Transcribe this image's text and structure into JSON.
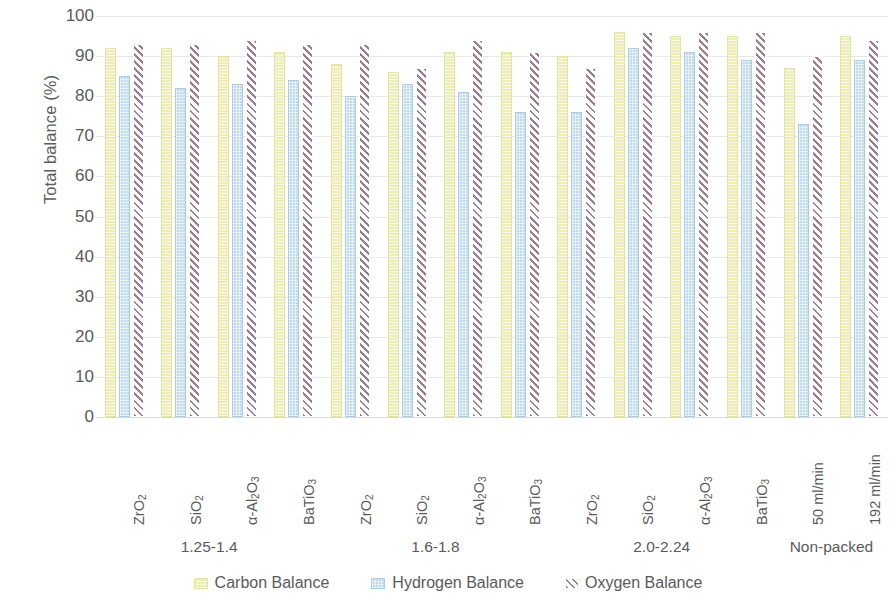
{
  "chart_data": {
    "type": "bar",
    "title": "",
    "xlabel": "",
    "ylabel": "Total balance (%)",
    "ylim": [
      0,
      100
    ],
    "ytick_step": 10,
    "yticks": [
      100,
      90,
      80,
      70,
      60,
      50,
      40,
      30,
      20,
      10,
      0
    ],
    "grid": true,
    "legend_position": "bottom",
    "categories": [
      "ZrO2",
      "SiO2",
      "a-Al2O3",
      "BaTiO3",
      "ZrO2",
      "SiO2",
      "a-Al2O3",
      "BaTiO3",
      "ZrO2",
      "SiO2",
      "a-Al2O3",
      "BaTiO3",
      "50 ml/min",
      "192 ml/min"
    ],
    "category_labels_html": [
      "ZrO<sub>2</sub>",
      "SiO<sub>2</sub>",
      "α-Al<sub>2</sub>O<sub>3</sub>",
      "BaTiO<sub>3</sub>",
      "ZrO<sub>2</sub>",
      "SiO<sub>2</sub>",
      "α-Al<sub>2</sub>O<sub>3</sub>",
      "BaTiO<sub>3</sub>",
      "ZrO<sub>2</sub>",
      "SiO<sub>2</sub>",
      "α-Al<sub>2</sub>O<sub>3</sub>",
      "BaTiO<sub>3</sub>",
      "50 ml/min",
      "192 ml/min"
    ],
    "groups": [
      {
        "label": "1.25-1.4",
        "span": [
          0,
          4
        ]
      },
      {
        "label": "1.6-1.8",
        "span": [
          4,
          8
        ]
      },
      {
        "label": "2.0-2.24",
        "span": [
          8,
          12
        ]
      },
      {
        "label": "Non-packed",
        "span": [
          12,
          14
        ]
      }
    ],
    "series": [
      {
        "name": "Carbon Balance",
        "color": "#ecedb9",
        "values": [
          92,
          92,
          90,
          91,
          88,
          86,
          91,
          91,
          90,
          96,
          95,
          95,
          87,
          95
        ]
      },
      {
        "name": "Hydrogen Balance",
        "color": "#c2dbeb",
        "values": [
          85,
          82,
          83,
          84,
          80,
          83,
          81,
          76,
          76,
          92,
          91,
          89,
          73,
          89
        ]
      },
      {
        "name": "Oxygen Balance",
        "color": "#9d7c8b",
        "values": [
          93,
          93,
          94,
          93,
          93,
          87,
          94,
          91,
          87,
          96,
          96,
          96,
          90,
          94
        ]
      }
    ]
  },
  "legend": {
    "items": [
      {
        "label": "Carbon Balance",
        "swatch": "carbon-swatch-icon"
      },
      {
        "label": "Hydrogen Balance",
        "swatch": "hydrogen-swatch-icon"
      },
      {
        "label": "Oxygen Balance",
        "swatch": "oxygen-swatch-icon"
      }
    ]
  }
}
